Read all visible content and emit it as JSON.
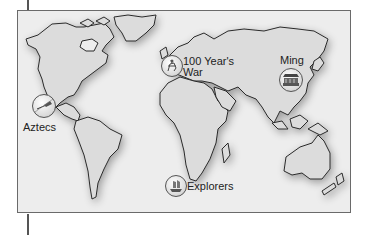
{
  "map": {
    "title": "World map of historical events",
    "colors": {
      "ocean": "#ededed",
      "land": "#dcdcdc",
      "coast": "#2a2a2a",
      "frame": "#6a6a6a"
    },
    "markers": [
      {
        "id": "aztecs",
        "label": "Aztecs",
        "icon": "ship-icon"
      },
      {
        "id": "hundred-years-war",
        "label_line1": "100 Year's",
        "label_line2": "War",
        "icon": "knight-icon"
      },
      {
        "id": "ming",
        "label": "Ming",
        "icon": "temple-icon"
      },
      {
        "id": "explorers",
        "label": "Explorers",
        "icon": "caravel-icon"
      }
    ]
  }
}
